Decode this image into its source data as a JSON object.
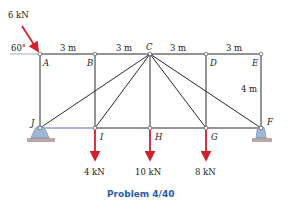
{
  "caption": "Problem 4/40",
  "colors": {
    "member": "#2b2b2b",
    "load_arrow": "#d0202a",
    "support_fill": "#9fb6d6",
    "ground": "#b8a9a6",
    "caption": "#2a5da8",
    "bottom_chord_left": "#5a6ab0"
  },
  "applied_load": {
    "label": "6 kN",
    "angle_label": "60°"
  },
  "spans": [
    "3 m",
    "3 m",
    "3 m",
    "3 m"
  ],
  "height_label": "4 m",
  "nodes": {
    "top": [
      "A",
      "B",
      "C",
      "D",
      "E"
    ],
    "bottom": [
      "J",
      "I",
      "H",
      "G",
      "F"
    ]
  },
  "loads": [
    {
      "node": "I",
      "label": "4 kN"
    },
    {
      "node": "H",
      "label": "10 kN"
    },
    {
      "node": "G",
      "label": "8 kN"
    }
  ],
  "supports": [
    {
      "node": "J",
      "type": "pin"
    },
    {
      "node": "F",
      "type": "pin"
    }
  ]
}
